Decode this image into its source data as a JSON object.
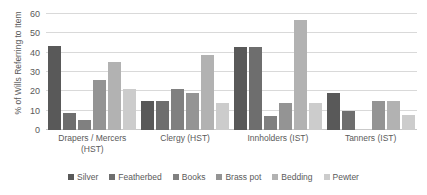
{
  "chart_data": {
    "type": "bar",
    "title": "",
    "subtitle": "",
    "xlabel": "",
    "ylabel": "% of Wills Referring to Item",
    "ylim": [
      0,
      60
    ],
    "yticks": [
      0,
      10,
      20,
      30,
      40,
      50,
      60
    ],
    "grid": true,
    "legend_position": "bottom",
    "categories": [
      "Drapers / Mercers (HST)",
      "Clergy (HST)",
      "Innholders (IST)",
      "Tanners (IST)"
    ],
    "series": [
      {
        "name": "Silver",
        "color": "#595959",
        "values": [
          43.5,
          15,
          43,
          19
        ]
      },
      {
        "name": "Featherbed",
        "color": "#6e6e6e",
        "values": [
          9,
          15,
          43,
          10
        ]
      },
      {
        "name": "Books",
        "color": "#808080",
        "values": [
          5,
          21,
          7,
          0
        ]
      },
      {
        "name": "Brass pot",
        "color": "#949494",
        "values": [
          26,
          19,
          14,
          15
        ]
      },
      {
        "name": "Bedding",
        "color": "#b2b2b2",
        "values": [
          35,
          39,
          57,
          15
        ]
      },
      {
        "name": "Pewter",
        "color": "#cccccc",
        "values": [
          21,
          14,
          14,
          8
        ]
      }
    ]
  }
}
